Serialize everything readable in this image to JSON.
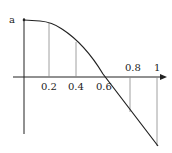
{
  "diagram": {
    "y_label": "a",
    "x_ticks": [
      {
        "label": "0.2"
      },
      {
        "label": "0.4"
      },
      {
        "label": "0.6"
      },
      {
        "label": "0.8"
      },
      {
        "label": "1"
      }
    ],
    "colors": {
      "axis": "#222222",
      "curve": "#222222",
      "guides": "#888888"
    }
  }
}
